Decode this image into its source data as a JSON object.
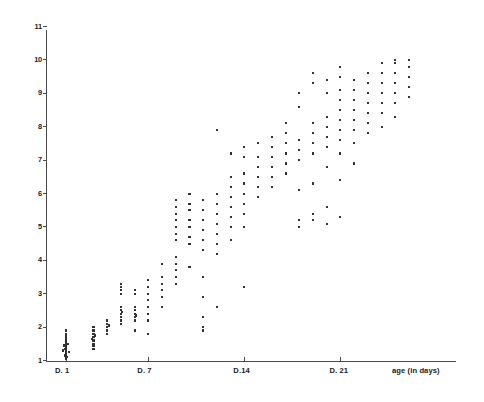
{
  "chart_data": {
    "type": "scatter",
    "title": "",
    "subtitle": "",
    "xlabel": "age (in days)",
    "ylabel": "",
    "xlim": [
      0,
      29
    ],
    "ylim": [
      1,
      11
    ],
    "grid": false,
    "legend": null,
    "x_tick_labels": [
      "D. 1",
      "D. 7",
      "D.14",
      "D. 21"
    ],
    "x_tick_values": [
      1,
      7,
      14,
      21
    ],
    "y_tick_labels": [
      "11",
      "10",
      "9",
      "8",
      "7",
      "6",
      "5",
      "4",
      "3",
      "2",
      "1"
    ],
    "y_tick_values": [
      11,
      10,
      9,
      8,
      7,
      6,
      5,
      4,
      3,
      2,
      1
    ],
    "series": [
      {
        "name": "measurements",
        "marker": "dot",
        "color": "#303030",
        "points": [
          [
            1,
            1.12
          ],
          [
            1,
            1.15
          ],
          [
            1,
            1.18
          ],
          [
            1,
            1.2
          ],
          [
            1,
            1.22
          ],
          [
            1,
            1.25
          ],
          [
            1,
            1.28
          ],
          [
            1,
            1.3
          ],
          [
            1,
            1.32
          ],
          [
            1,
            1.35
          ],
          [
            1,
            1.38
          ],
          [
            1,
            1.4
          ],
          [
            1,
            1.45
          ],
          [
            1,
            1.5
          ],
          [
            1,
            1.55
          ],
          [
            1,
            1.6
          ],
          [
            1,
            1.65
          ],
          [
            1,
            1.72
          ],
          [
            1,
            1.8
          ],
          [
            1,
            1.9
          ],
          [
            0.8,
            1.3
          ],
          [
            1.2,
            1.25
          ],
          [
            0.85,
            1.45
          ],
          [
            1.15,
            1.5
          ],
          [
            0.9,
            1.15
          ],
          [
            1.1,
            1.1
          ],
          [
            1,
            1.05
          ],
          [
            0.95,
            1.35
          ],
          [
            3,
            1.5
          ],
          [
            3,
            1.6
          ],
          [
            3,
            1.7
          ],
          [
            3,
            1.8
          ],
          [
            3,
            1.9
          ],
          [
            3,
            2.0
          ],
          [
            3,
            1.45
          ],
          [
            3.1,
            1.75
          ],
          [
            2.9,
            1.65
          ],
          [
            3,
            1.35
          ],
          [
            4,
            2.0
          ],
          [
            4,
            2.1
          ],
          [
            4,
            2.2
          ],
          [
            4,
            1.8
          ],
          [
            4,
            1.9
          ],
          [
            4.1,
            2.05
          ],
          [
            5,
            2.2
          ],
          [
            5,
            2.4
          ],
          [
            5,
            2.5
          ],
          [
            5,
            2.6
          ],
          [
            5,
            2.3
          ],
          [
            5,
            2.1
          ],
          [
            5,
            3.0
          ],
          [
            5,
            3.1
          ],
          [
            5,
            3.2
          ],
          [
            5,
            3.3
          ],
          [
            5.1,
            2.45
          ],
          [
            6,
            2.2
          ],
          [
            6,
            2.3
          ],
          [
            6,
            2.4
          ],
          [
            6,
            2.5
          ],
          [
            6,
            2.6
          ],
          [
            6,
            3.0
          ],
          [
            6,
            3.1
          ],
          [
            6,
            1.9
          ],
          [
            6.1,
            2.35
          ],
          [
            7,
            2.6
          ],
          [
            7,
            2.8
          ],
          [
            7,
            3.0
          ],
          [
            7,
            3.2
          ],
          [
            7,
            2.4
          ],
          [
            7,
            2.2
          ],
          [
            7,
            1.8
          ],
          [
            7,
            3.4
          ],
          [
            8,
            2.9
          ],
          [
            8,
            3.1
          ],
          [
            8,
            3.3
          ],
          [
            8,
            3.5
          ],
          [
            8,
            2.6
          ],
          [
            8,
            3.9
          ],
          [
            9,
            3.5
          ],
          [
            9,
            3.7
          ],
          [
            9,
            3.9
          ],
          [
            9,
            4.1
          ],
          [
            9,
            3.3
          ],
          [
            9,
            4.6
          ],
          [
            9,
            4.8
          ],
          [
            9,
            5.0
          ],
          [
            9,
            5.2
          ],
          [
            9,
            5.4
          ],
          [
            9,
            5.6
          ],
          [
            9,
            5.8
          ],
          [
            10,
            4.5
          ],
          [
            10,
            4.7
          ],
          [
            10,
            5.0
          ],
          [
            10,
            5.2
          ],
          [
            10,
            5.5
          ],
          [
            10,
            5.7
          ],
          [
            10,
            3.8
          ],
          [
            10,
            6.0
          ],
          [
            11,
            4.3
          ],
          [
            11,
            4.6
          ],
          [
            11,
            4.9
          ],
          [
            11,
            5.2
          ],
          [
            11,
            5.5
          ],
          [
            11,
            5.8
          ],
          [
            11,
            3.5
          ],
          [
            11,
            2.9
          ],
          [
            11,
            2.3
          ],
          [
            11,
            2.0
          ],
          [
            11,
            1.9
          ],
          [
            12,
            4.5
          ],
          [
            12,
            4.8
          ],
          [
            12,
            5.1
          ],
          [
            12,
            5.4
          ],
          [
            12,
            5.7
          ],
          [
            12,
            6.0
          ],
          [
            12,
            4.2
          ],
          [
            12,
            2.6
          ],
          [
            12,
            7.9
          ],
          [
            13,
            5.0
          ],
          [
            13,
            5.3
          ],
          [
            13,
            5.6
          ],
          [
            13,
            5.9
          ],
          [
            13,
            6.2
          ],
          [
            13,
            6.5
          ],
          [
            13,
            4.6
          ],
          [
            13,
            7.2
          ],
          [
            14,
            5.4
          ],
          [
            14,
            5.7
          ],
          [
            14,
            6.0
          ],
          [
            14,
            6.3
          ],
          [
            14,
            6.6
          ],
          [
            14,
            5.0
          ],
          [
            14,
            7.1
          ],
          [
            14,
            7.4
          ],
          [
            14,
            3.2
          ],
          [
            15,
            6.2
          ],
          [
            15,
            6.5
          ],
          [
            15,
            6.8
          ],
          [
            15,
            7.1
          ],
          [
            15,
            5.9
          ],
          [
            15,
            7.5
          ],
          [
            16,
            6.5
          ],
          [
            16,
            6.8
          ],
          [
            16,
            7.1
          ],
          [
            16,
            7.4
          ],
          [
            16,
            6.2
          ],
          [
            16,
            7.7
          ],
          [
            17,
            6.9
          ],
          [
            17,
            7.2
          ],
          [
            17,
            7.5
          ],
          [
            17,
            7.8
          ],
          [
            17,
            6.6
          ],
          [
            17,
            8.1
          ],
          [
            18,
            7.0
          ],
          [
            18,
            7.3
          ],
          [
            18,
            7.6
          ],
          [
            18,
            6.1
          ],
          [
            18,
            5.2
          ],
          [
            18,
            5.0
          ],
          [
            18,
            8.6
          ],
          [
            18,
            9.0
          ],
          [
            19,
            7.2
          ],
          [
            19,
            7.5
          ],
          [
            19,
            7.8
          ],
          [
            19,
            8.1
          ],
          [
            19,
            6.3
          ],
          [
            19,
            5.4
          ],
          [
            19,
            5.2
          ],
          [
            19,
            9.3
          ],
          [
            19,
            9.6
          ],
          [
            20,
            7.4
          ],
          [
            20,
            7.7
          ],
          [
            20,
            8.0
          ],
          [
            20,
            8.3
          ],
          [
            20,
            6.8
          ],
          [
            20,
            5.6
          ],
          [
            20,
            5.1
          ],
          [
            20,
            9.0
          ],
          [
            20,
            9.4
          ],
          [
            21,
            7.6
          ],
          [
            21,
            7.9
          ],
          [
            21,
            8.2
          ],
          [
            21,
            8.5
          ],
          [
            21,
            8.8
          ],
          [
            21,
            7.2
          ],
          [
            21,
            6.4
          ],
          [
            21,
            5.3
          ],
          [
            21,
            9.1
          ],
          [
            21,
            9.5
          ],
          [
            21,
            9.8
          ],
          [
            22,
            7.9
          ],
          [
            22,
            8.2
          ],
          [
            22,
            8.5
          ],
          [
            22,
            8.8
          ],
          [
            22,
            9.1
          ],
          [
            22,
            7.5
          ],
          [
            22,
            9.4
          ],
          [
            22,
            6.9
          ],
          [
            23,
            8.1
          ],
          [
            23,
            8.4
          ],
          [
            23,
            8.7
          ],
          [
            23,
            9.0
          ],
          [
            23,
            9.3
          ],
          [
            23,
            7.8
          ],
          [
            23,
            9.6
          ],
          [
            24,
            8.4
          ],
          [
            24,
            8.7
          ],
          [
            24,
            9.0
          ],
          [
            24,
            9.3
          ],
          [
            24,
            9.6
          ],
          [
            24,
            8.0
          ],
          [
            24,
            9.9
          ],
          [
            25,
            8.7
          ],
          [
            25,
            9.0
          ],
          [
            25,
            9.3
          ],
          [
            25,
            9.6
          ],
          [
            25,
            9.9
          ],
          [
            25,
            8.3
          ],
          [
            25,
            10.0
          ],
          [
            26,
            9.2
          ],
          [
            26,
            9.5
          ],
          [
            26,
            9.8
          ],
          [
            26,
            10.0
          ],
          [
            26,
            8.9
          ]
        ]
      }
    ]
  }
}
